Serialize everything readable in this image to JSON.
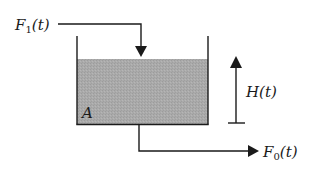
{
  "diagram": {
    "type": "tank-level-process",
    "labels": {
      "inflow": "F",
      "inflow_sub": "1",
      "inflow_arg": "(t)",
      "outflow": "F",
      "outflow_sub": "0",
      "outflow_arg": "(t)",
      "height": "H(t)",
      "area": "A"
    },
    "colors": {
      "line": "#1a1a1a",
      "liquid": "#a9a9a9",
      "background": "#ffffff"
    }
  }
}
